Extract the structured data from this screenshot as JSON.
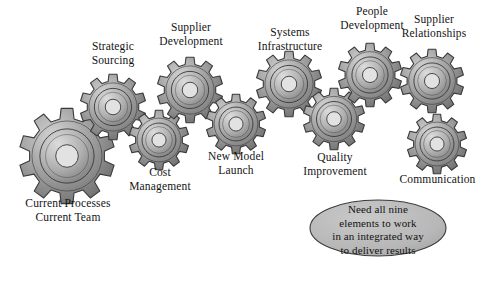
{
  "diagram": {
    "background_color": "#ffffff",
    "gear_fill_light": "#d4d4d4",
    "gear_fill_mid": "#a8a8a8",
    "gear_fill_dark": "#6e6e6e",
    "gear_outline": "#3a3a3a",
    "hub_color": "#e2e2e2",
    "label_color": "#141414"
  },
  "gears": [
    {
      "id": "current-processes",
      "label": "Current Processes\nCurrent Team",
      "teeth": 10,
      "cx": 67,
      "cy": 156,
      "r": 48,
      "label_x": 10,
      "label_y": 197,
      "label_w": 116
    },
    {
      "id": "strategic-sourcing",
      "label": "Strategic\nSourcing",
      "teeth": 10,
      "cx": 113,
      "cy": 107,
      "r": 33,
      "label_x": 72,
      "label_y": 40,
      "label_w": 82
    },
    {
      "id": "cost-management",
      "label": "Cost\nManagement",
      "teeth": 10,
      "cx": 159,
      "cy": 140,
      "r": 30,
      "label_x": 108,
      "label_y": 166,
      "label_w": 104
    },
    {
      "id": "supplier-development",
      "label": "Supplier\nDevelopment",
      "teeth": 10,
      "cx": 190,
      "cy": 90,
      "r": 33,
      "label_x": 139,
      "label_y": 21,
      "label_w": 104
    },
    {
      "id": "new-model-launch",
      "label": "New Model\nLaunch",
      "teeth": 10,
      "cx": 236,
      "cy": 124,
      "r": 30,
      "label_x": 188,
      "label_y": 150,
      "label_w": 96
    },
    {
      "id": "systems-infrastructure",
      "label": "Systems\nInfrastructure",
      "teeth": 10,
      "cx": 289,
      "cy": 84,
      "r": 33,
      "label_x": 235,
      "label_y": 26,
      "label_w": 110
    },
    {
      "id": "quality-improvement",
      "label": "Quality\nImprovement",
      "teeth": 10,
      "cx": 334,
      "cy": 119,
      "r": 31,
      "label_x": 283,
      "label_y": 151,
      "label_w": 104
    },
    {
      "id": "people-development",
      "label": "People\nDevelopment",
      "teeth": 10,
      "cx": 370,
      "cy": 75,
      "r": 32,
      "label_x": 320,
      "label_y": 5,
      "label_w": 104
    },
    {
      "id": "supplier-relationships",
      "label": "Supplier\nRelationships",
      "teeth": 10,
      "cx": 432,
      "cy": 81,
      "r": 32,
      "label_x": 381,
      "label_y": 13,
      "label_w": 106
    },
    {
      "id": "communication",
      "label": "Communication",
      "teeth": 10,
      "cx": 437,
      "cy": 144,
      "r": 30,
      "label_x": 380,
      "label_y": 173,
      "label_w": 115
    }
  ],
  "callout": {
    "text": "Need all nine\nelements to work\nin an integrated way\nto deliver results",
    "cx": 378,
    "cy": 228,
    "rx": 68,
    "ry": 28,
    "fill": "#b9b9b9",
    "stroke": "#3a3a3a",
    "text_x": 310,
    "text_y": 203,
    "text_w": 136
  }
}
